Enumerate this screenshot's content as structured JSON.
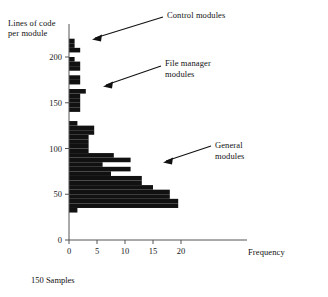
{
  "chart_data": {
    "type": "bar",
    "orientation": "horizontal",
    "title": "",
    "subtitle": "",
    "xlabel": "Frequency",
    "ylabel": "Lines of code\nper module",
    "note": "150 Samples",
    "xlim": [
      0,
      24
    ],
    "ylim": [
      0,
      225
    ],
    "grid": false,
    "legend": null,
    "xticks": [
      0,
      5,
      10,
      15,
      20
    ],
    "xticklabels": [
      "0",
      "5",
      "10",
      "15",
      "20"
    ],
    "yticks": [
      0,
      50,
      100,
      150,
      200
    ],
    "yticklabels": [
      "0",
      "50",
      "100",
      "150",
      "200"
    ],
    "bar_color": "#111111",
    "axis_color": "#555555",
    "bin_width": 5,
    "categories": [
      "30-35",
      "35-40",
      "40-45",
      "45-50",
      "50-55",
      "55-60",
      "60-65",
      "65-70",
      "70-75",
      "75-80",
      "80-85",
      "85-90",
      "90-95",
      "95-100",
      "100-105",
      "105-110",
      "110-115",
      "115-120",
      "120-125",
      "125-130",
      "130-135",
      "135-140",
      "140-145",
      "145-150",
      "150-155",
      "155-160",
      "160-165",
      "165-170",
      "170-175",
      "175-180",
      "180-185",
      "185-190",
      "190-195",
      "195-200",
      "200-205",
      "205-210",
      "210-215",
      "215-220"
    ],
    "values": [
      1.5,
      19.5,
      19.5,
      18,
      18,
      15,
      13,
      13,
      7.5,
      11,
      6,
      11,
      8,
      3.5,
      3.5,
      3.5,
      3.5,
      4.5,
      4.5,
      1.5,
      0,
      0,
      2,
      2,
      2,
      2,
      3,
      0,
      2,
      2,
      0,
      2,
      2,
      1,
      0,
      2,
      1,
      1
    ],
    "annotations": [
      {
        "id": "control",
        "text": "Control modules",
        "target_bin": "205-215"
      },
      {
        "id": "filemanager",
        "text": "File manager\nmodules",
        "target_bin": "160-165"
      },
      {
        "id": "general",
        "text": "General\nmodules",
        "target_bin": "75-80"
      }
    ]
  }
}
